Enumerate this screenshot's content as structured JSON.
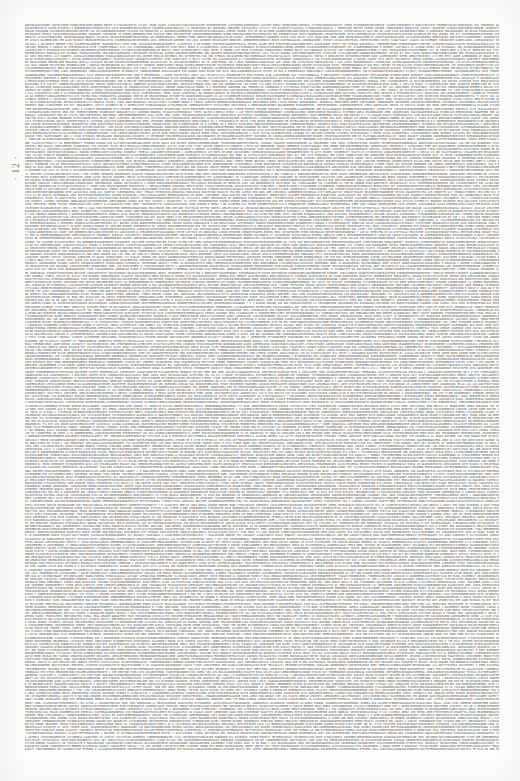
{
  "page": {
    "kind": "scanned-document-page",
    "page_marker": "· 12 ·",
    "background_color": "#fdfdfc",
    "ink_color": "#43423f",
    "body": {
      "description": "Full-page block of dense, justified, machine-printed numeric data — continuous strings of digits separated by spaces, filling the entire text area with no headings, paragraph breaks, or ragged lines.",
      "character_set": "0123456789",
      "alignment": "justified",
      "columns": 1,
      "approx_line_count": 234,
      "seed_text": "371234996756149442975761441356171398680890952863652384592461566817586470108711521286171257090366491745510383864661856097947194122551137491615176347212906266197257536976937884246312276176539673717054991258496158900214714374361571251141214591219176553889352348171149118119199381129719142125452391971614497141337931524554621936111218474612271221357351991496459733731841451137789551312521295119427181527211135237195521355246237771272415512349723135755412341249739174497171357913256123614113951123624611224149511623572156135511923724971357111341925356"
    }
  }
}
